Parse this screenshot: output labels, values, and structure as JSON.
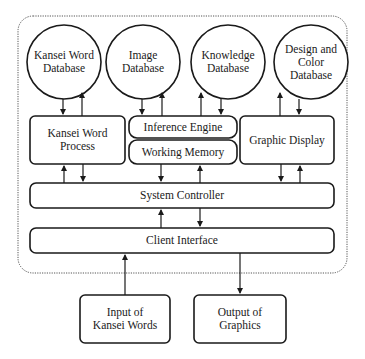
{
  "diagram": {
    "colors": {
      "stroke": "#1a1a1a",
      "background": "#ffffff",
      "boundary": "#555555"
    },
    "databases": [
      {
        "id": "kansei-word-database",
        "label": "Kansei Word\nDatabase"
      },
      {
        "id": "image-database",
        "label": "Image\nDatabase"
      },
      {
        "id": "knowledge-database",
        "label": "Knowledge\nDatabase"
      },
      {
        "id": "design-color-database",
        "label": "Design and\nColor\nDatabase"
      }
    ],
    "modules": {
      "kansei_word_process": "Kansei Word\nProcess",
      "inference_engine": "Inference Engine",
      "working_memory": "Working Memory",
      "graphic_display": "Graphic Display",
      "system_controller": "System Controller",
      "client_interface": "Client Interface"
    },
    "external": {
      "input": "Input of\nKansei Words",
      "output": "Output of\nGraphics"
    },
    "edges": [
      {
        "from": "Kansei Word Database",
        "to": "Kansei Word Process"
      },
      {
        "from": "Kansei Word Process",
        "to": "Kansei Word Database"
      },
      {
        "from": "Image Database",
        "to": "Inference Engine"
      },
      {
        "from": "Inference Engine",
        "to": "Image Database"
      },
      {
        "from": "Inference Engine",
        "to": "Knowledge Database"
      },
      {
        "from": "Knowledge Database",
        "to": "Inference Engine"
      },
      {
        "from": "Graphic Display",
        "to": "Design and Color Database"
      },
      {
        "from": "Design and Color Database",
        "to": "Graphic Display"
      },
      {
        "from": "System Controller",
        "to": "Kansei Word Process"
      },
      {
        "from": "Kansei Word Process",
        "to": "System Controller"
      },
      {
        "from": "Working Memory",
        "to": "System Controller"
      },
      {
        "from": "System Controller",
        "to": "Working Memory"
      },
      {
        "from": "Graphic Display",
        "to": "System Controller"
      },
      {
        "from": "System Controller",
        "to": "Graphic Display"
      },
      {
        "from": "Client Interface",
        "to": "System Controller"
      },
      {
        "from": "System Controller",
        "to": "Client Interface"
      },
      {
        "from": "Input of Kansei Words",
        "to": "Client Interface"
      },
      {
        "from": "Client Interface",
        "to": "Output of Graphics"
      }
    ]
  }
}
